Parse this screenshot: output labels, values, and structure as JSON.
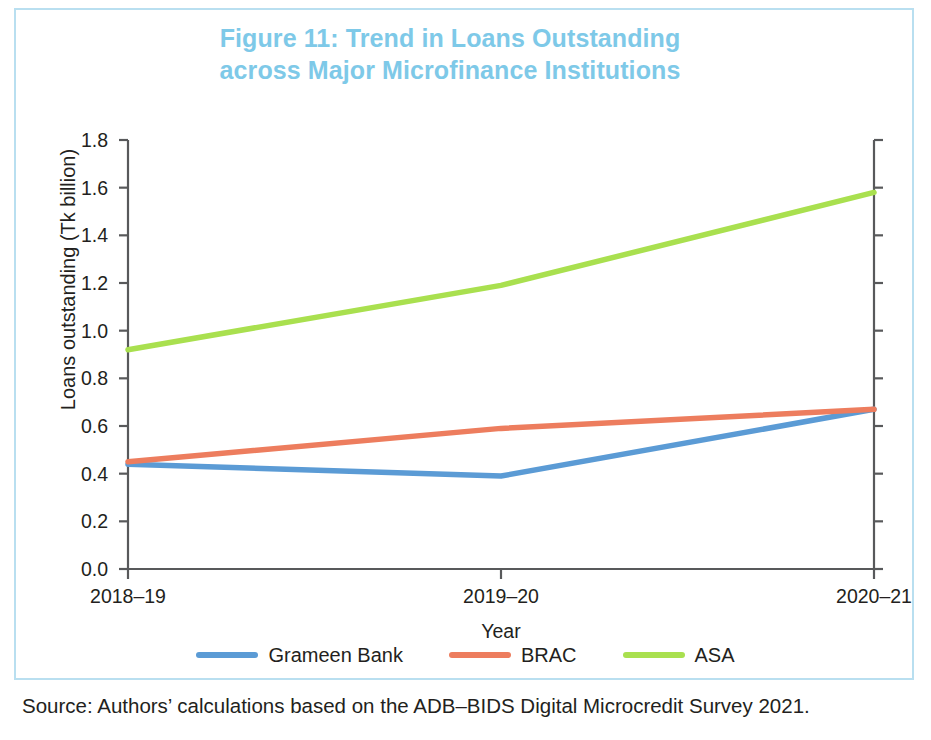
{
  "figure": {
    "title_line1": "Figure 11: Trend in Loans Outstanding",
    "title_line2": "across Major Microfinance Institutions",
    "title_color": "#7ec9e8",
    "border_color": "#b9dff0",
    "source": "Source: Authors’ calculations based on the ADB–BIDS Digital Microcredit Survey 2021."
  },
  "chart_data": {
    "type": "line",
    "title": "Figure 11: Trend in Loans Outstanding across Major Microfinance Institutions",
    "xlabel": "Year",
    "ylabel": "Loans outstanding (Tk billion)",
    "categories": [
      "2018–19",
      "2019–20",
      "2020–21"
    ],
    "ylim": [
      0.0,
      1.8
    ],
    "yticks": [
      "0.0",
      "0.2",
      "0.4",
      "0.6",
      "0.8",
      "1.0",
      "1.2",
      "1.4",
      "1.6",
      "1.8"
    ],
    "ytick_values": [
      0.0,
      0.2,
      0.4,
      0.6,
      0.8,
      1.0,
      1.2,
      1.4,
      1.6,
      1.8
    ],
    "grid": false,
    "legend_position": "bottom",
    "series": [
      {
        "name": "Grameen Bank",
        "color": "#5b9bd5",
        "values": [
          0.44,
          0.39,
          0.67
        ]
      },
      {
        "name": "BRAC",
        "color": "#ed7d5e",
        "values": [
          0.45,
          0.59,
          0.67
        ]
      },
      {
        "name": "ASA",
        "color": "#a9e04f",
        "values": [
          0.92,
          1.19,
          1.58
        ]
      }
    ]
  }
}
